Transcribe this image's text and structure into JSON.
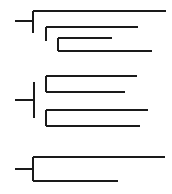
{
  "figure": {
    "width": 172,
    "height": 194,
    "background_color": "#ffffff",
    "line_color": "#1a1a1a",
    "line_width": 2,
    "style": "rectangular",
    "orientation": "left-to-right",
    "cluster_count": 3,
    "tip_count_total": 10
  },
  "chart_data": {
    "type": "diagram",
    "subtype": "cladogram",
    "xlabel": "",
    "ylabel": "",
    "grid": false,
    "legend": false,
    "axis_visible": false,
    "labels_visible": false,
    "clusters": [
      {
        "id": "cluster-1",
        "name": "upper-clade",
        "topology": "ladderized",
        "tip_count": 4,
        "stem": {
          "x1": 15,
          "x2": 33,
          "y": 21
        },
        "nodes": [
          {
            "id": "n1",
            "x": 33,
            "y_top": 11,
            "y_bottom": 33
          },
          {
            "id": "n2",
            "x": 46,
            "y_top": 27,
            "y_bottom": 41
          },
          {
            "id": "n3",
            "x": 58,
            "y_top": 38,
            "y_bottom": 51
          }
        ],
        "tips": [
          {
            "id": "t1",
            "depth": 1,
            "y": 11,
            "x_start": 33,
            "x_end": 166,
            "length": 133
          },
          {
            "id": "t2",
            "depth": 2,
            "y": 27,
            "x_start": 46,
            "x_end": 138,
            "length": 92
          },
          {
            "id": "t3",
            "depth": 3,
            "y": 38,
            "x_start": 58,
            "x_end": 112,
            "length": 54
          },
          {
            "id": "t4",
            "depth": 3,
            "y": 51,
            "x_start": 58,
            "x_end": 152,
            "length": 94
          }
        ]
      },
      {
        "id": "cluster-2",
        "name": "middle-clade",
        "topology": "balanced",
        "tip_count": 4,
        "stem": {
          "x1": 15,
          "x2": 34,
          "y": 100
        },
        "nodes": [
          {
            "id": "n4",
            "x": 34,
            "y_top": 82,
            "y_bottom": 118
          },
          {
            "id": "n5",
            "x": 46,
            "y_top": 76,
            "y_bottom": 92
          },
          {
            "id": "n6",
            "x": 46,
            "y_top": 110,
            "y_bottom": 126
          }
        ],
        "tips": [
          {
            "id": "t5",
            "depth": 2,
            "y": 76,
            "x_start": 46,
            "x_end": 137,
            "length": 91
          },
          {
            "id": "t6",
            "depth": 2,
            "y": 92,
            "x_start": 46,
            "x_end": 125,
            "length": 79
          },
          {
            "id": "t7",
            "depth": 2,
            "y": 110,
            "x_start": 46,
            "x_end": 148,
            "length": 102
          },
          {
            "id": "t8",
            "depth": 2,
            "y": 126,
            "x_start": 46,
            "x_end": 140,
            "length": 94
          }
        ]
      },
      {
        "id": "cluster-3",
        "name": "lower-clade",
        "topology": "cherry",
        "tip_count": 2,
        "stem": {
          "x1": 15,
          "x2": 33,
          "y": 169
        },
        "nodes": [
          {
            "id": "n7",
            "x": 33,
            "y_top": 157,
            "y_bottom": 181
          }
        ],
        "tips": [
          {
            "id": "t9",
            "depth": 1,
            "y": 157,
            "x_start": 33,
            "x_end": 165,
            "length": 132
          },
          {
            "id": "t10",
            "depth": 1,
            "y": 181,
            "x_start": 33,
            "x_end": 118,
            "length": 85
          }
        ]
      }
    ]
  }
}
